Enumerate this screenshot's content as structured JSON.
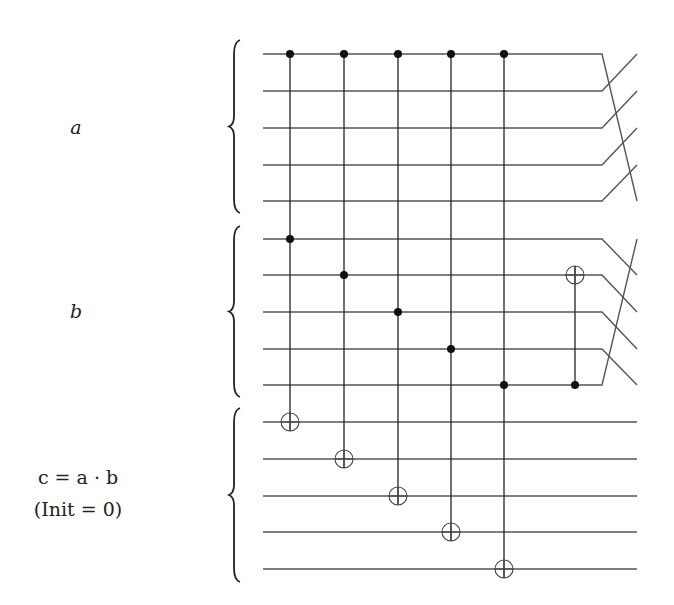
{
  "diagram": {
    "registers": [
      {
        "id": "a",
        "label": "a",
        "label_lines": [
          "a"
        ],
        "wires_y": [
          54,
          91,
          128,
          165,
          201
        ],
        "brace": [
          40,
          213
        ],
        "label_y": 128
      },
      {
        "id": "b",
        "label": "b",
        "label_lines": [
          "b"
        ],
        "wires_y": [
          239,
          275,
          312,
          349,
          385
        ],
        "brace": [
          226,
          397
        ],
        "label_y": 312
      },
      {
        "id": "c",
        "label": "c = a · b (Init = 0)",
        "label_lines": [
          "c = a · b",
          "(Init = 0)"
        ],
        "wires_y": [
          422,
          459,
          496,
          532,
          569
        ],
        "brace": [
          408,
          582
        ],
        "label_y": 478
      }
    ],
    "wire_start_x": 263,
    "wire_end_x": 602,
    "output_x": 637,
    "toffoli_gates": [
      {
        "x": 290,
        "controls": [
          "a0",
          "b0"
        ],
        "target": "c0"
      },
      {
        "x": 344,
        "controls": [
          "a0",
          "b1"
        ],
        "target": "c1"
      },
      {
        "x": 398,
        "controls": [
          "a0",
          "b2"
        ],
        "target": "c2"
      },
      {
        "x": 451,
        "controls": [
          "a0",
          "b3"
        ],
        "target": "c3"
      },
      {
        "x": 504,
        "controls": [
          "a0",
          "b4"
        ],
        "target": "c4"
      }
    ],
    "cnot_gates": [
      {
        "x": 575,
        "control": "b4",
        "target": "b1"
      }
    ],
    "permutations": [
      {
        "register": "a",
        "type": "cyclic-shift",
        "description": "top wire moves to bottom, others shift up"
      },
      {
        "register": "b",
        "type": "cyclic-shift",
        "description": "bottom wire moves to top, others shift down"
      }
    ],
    "colors": {
      "wire": "#555555",
      "control": "#111111",
      "background": "#ffffff"
    }
  }
}
